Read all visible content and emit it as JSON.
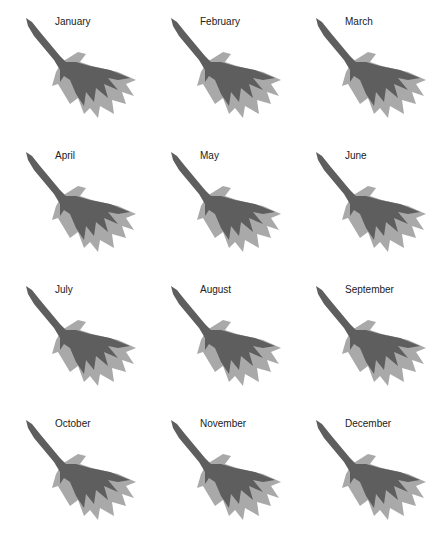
{
  "figure": {
    "legend_colors": {
      "dark": "#5e5e5e",
      "light": "#a9a9a9",
      "background": "#ffffff"
    },
    "panels": [
      {
        "label": "January"
      },
      {
        "label": "February"
      },
      {
        "label": "March"
      },
      {
        "label": "April"
      },
      {
        "label": "May"
      },
      {
        "label": "June"
      },
      {
        "label": "July"
      },
      {
        "label": "August"
      },
      {
        "label": "September"
      },
      {
        "label": "October"
      },
      {
        "label": "November"
      },
      {
        "label": "December"
      }
    ]
  }
}
